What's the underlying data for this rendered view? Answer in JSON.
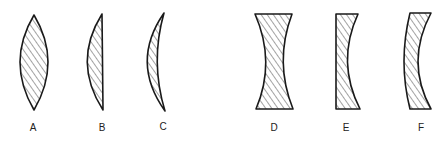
{
  "diagram": {
    "title": "",
    "groups": [
      {
        "name": "converging lenses",
        "lenses": [
          "A",
          "B",
          "C"
        ]
      },
      {
        "name": "diverging lenses",
        "lenses": [
          "D",
          "E",
          "F"
        ]
      }
    ],
    "lenses": [
      {
        "label": "A",
        "shape": "biconvex"
      },
      {
        "label": "B",
        "shape": "plano-convex"
      },
      {
        "label": "C",
        "shape": "convex-meniscus"
      },
      {
        "label": "D",
        "shape": "biconcave"
      },
      {
        "label": "E",
        "shape": "plano-concave"
      },
      {
        "label": "F",
        "shape": "concave-meniscus"
      }
    ],
    "colors": {
      "stroke": "#1a1a1a",
      "hatch": "#333333",
      "background": "#ffffff"
    }
  }
}
